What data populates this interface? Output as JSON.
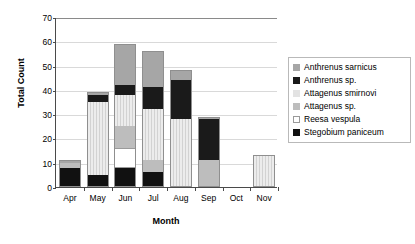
{
  "chart_data": {
    "type": "bar",
    "subtype": "stacked-bar",
    "title": "",
    "xlabel": "Month",
    "ylabel": "Total Count",
    "categories": [
      "Apr",
      "May",
      "Jun",
      "Jul",
      "Aug",
      "Sep",
      "Oct",
      "Nov"
    ],
    "ylim": [
      0,
      70
    ],
    "yticks": [
      0,
      10,
      20,
      30,
      40,
      50,
      60,
      70
    ],
    "grid": true,
    "legend_position": "right",
    "series": [
      {
        "name": "Anthrenus sarnicus",
        "color": "#a6a6a6",
        "values": [
          1,
          1,
          17,
          15,
          4,
          1,
          0,
          0
        ]
      },
      {
        "name": "Anthrenus sp.",
        "color": "#1a1a1a",
        "values": [
          0,
          3,
          4,
          9,
          16,
          17,
          0,
          0
        ]
      },
      {
        "name": "Attagenus smirnovi",
        "color": "#e3e3e3",
        "values": [
          0,
          30,
          13,
          21,
          28,
          0,
          0,
          13
        ]
      },
      {
        "name": "Attagenus sp.",
        "color": "#bdbdbd",
        "values": [
          2,
          0,
          9,
          5,
          0,
          11,
          0,
          0
        ]
      },
      {
        "name": "Reesa vespula",
        "color": "#ffffff",
        "values": [
          0,
          0,
          8,
          0,
          0,
          0,
          0,
          0
        ]
      },
      {
        "name": "Stegobium paniceum",
        "color": "#111111",
        "values": [
          8,
          5,
          8,
          6,
          0,
          0,
          0,
          0
        ]
      }
    ],
    "stack_order": [
      "Stegobium paniceum",
      "Reesa vespula",
      "Attagenus sp.",
      "Attagenus smirnovi",
      "Anthrenus sp.",
      "Anthrenus sarnicus"
    ],
    "totals": [
      11,
      39,
      59,
      56,
      48,
      29,
      0,
      13
    ]
  },
  "legend": {
    "items": [
      {
        "label": "Anthrenus sarnicus",
        "swatch": "#a6a6a6"
      },
      {
        "label": "Anthrenus sp.",
        "swatch": "#1a1a1a"
      },
      {
        "label": "Attagenus smirnovi",
        "swatch": "#e3e3e3"
      },
      {
        "label": "Attagenus sp.",
        "swatch": "#bdbdbd"
      },
      {
        "label": "Reesa vespula",
        "swatch": "#ffffff"
      },
      {
        "label": "Stegobium paniceum",
        "swatch": "#111111"
      }
    ]
  }
}
